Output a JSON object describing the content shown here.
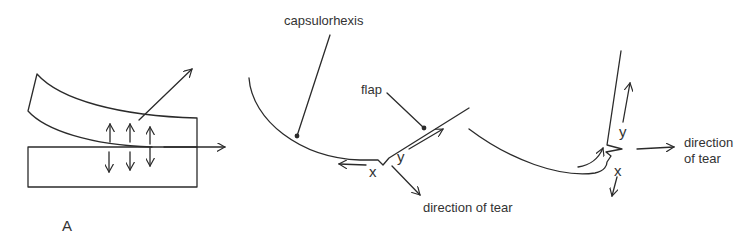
{
  "figure": {
    "panel_a": {
      "caption": "A"
    },
    "panel_b": {
      "labels": {
        "capsulorhexis": "capsulorhexis",
        "flap": "flap",
        "x": "x",
        "y": "y",
        "direction": "direction of tear"
      }
    },
    "panel_c": {
      "labels": {
        "x": "x",
        "y": "y",
        "direction_line1": "direction",
        "direction_line2": "of tear"
      }
    },
    "colors": {
      "stroke": "#2b2b2b",
      "text": "#333333",
      "background": "#ffffff"
    }
  }
}
